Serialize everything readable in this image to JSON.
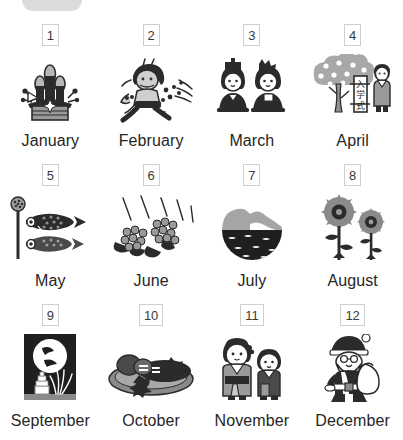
{
  "page": {
    "background_color": "#ffffff",
    "top_pill": {
      "name": "top-pill",
      "color": "#dcdcdc",
      "visible_label": ""
    }
  },
  "grid": {
    "columns": 4,
    "rows": 3,
    "number_box": {
      "border_color": "#cfcfcf",
      "text_color": "#3a3a3a"
    },
    "label_color": "#262626",
    "items": [
      {
        "number": "1",
        "label": "January",
        "icon": "kadomatsu-icon"
      },
      {
        "number": "2",
        "label": "February",
        "icon": "setsubun-oni-icon"
      },
      {
        "number": "3",
        "label": "March",
        "icon": "hina-dolls-icon"
      },
      {
        "number": "4",
        "label": "April",
        "icon": "cherry-tree-entrance-ceremony-icon"
      },
      {
        "number": "5",
        "label": "May",
        "icon": "koinobori-icon"
      },
      {
        "number": "6",
        "label": "June",
        "icon": "hydrangea-rain-icon"
      },
      {
        "number": "7",
        "label": "July",
        "icon": "sea-beach-icon"
      },
      {
        "number": "8",
        "label": "August",
        "icon": "sunflowers-icon"
      },
      {
        "number": "9",
        "label": "September",
        "icon": "tsukimi-moon-icon"
      },
      {
        "number": "10",
        "label": "October",
        "icon": "autumn-food-plate-icon"
      },
      {
        "number": "11",
        "label": "November",
        "icon": "shichigosan-children-icon"
      },
      {
        "number": "12",
        "label": "December",
        "icon": "santa-claus-icon"
      }
    ]
  },
  "april_sign_text": "入学式"
}
